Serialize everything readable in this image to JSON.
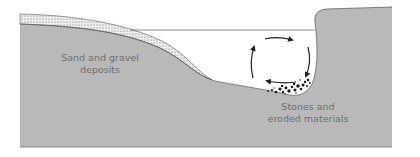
{
  "diagram": {
    "labels": {
      "deposit_line1": "Sand and gravel",
      "deposit_line2": "deposits",
      "erosion_line1": "Stones and",
      "erosion_line2": "eroded materials"
    },
    "colors": {
      "ground": "#b9b9b9",
      "sand": "#eeeeee",
      "sand_dots": "#6a6a6a",
      "water": "#ffffff",
      "outline": "#555555",
      "arrows": "#222222",
      "stones": "#1a1a1a",
      "label_text": "#6f6f6f"
    },
    "elements": [
      "ground",
      "sand-deposit-layer",
      "water-surface",
      "circular-current-arrows",
      "stones-eroded-materials"
    ]
  }
}
